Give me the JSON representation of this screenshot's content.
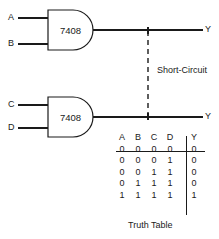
{
  "diagram": {
    "title": "Short-Circuit",
    "gates": [
      {
        "id": "gate-1",
        "part_number": "7408",
        "type": "AND",
        "inputs": [
          "A",
          "B"
        ],
        "output": "Y"
      },
      {
        "id": "gate-2",
        "part_number": "7408",
        "type": "AND",
        "inputs": [
          "C",
          "D"
        ],
        "output": "Y"
      }
    ],
    "short_circuit_label": "Short-Circuit",
    "input_labels": {
      "a": "A",
      "b": "B",
      "c": "C",
      "d": "D"
    },
    "output_labels": {
      "top": "Y",
      "bottom": "Y"
    },
    "colors": {
      "line": "#1a1a1a",
      "background": "#ffffff"
    }
  },
  "truth_table": {
    "caption": "Truth Table",
    "headers": [
      "A",
      "B",
      "C",
      "D",
      "Y"
    ],
    "rows": [
      [
        "0",
        "0",
        "0",
        "0",
        "0"
      ],
      [
        "0",
        "0",
        "0",
        "1",
        "0"
      ],
      [
        "0",
        "0",
        "1",
        "1",
        "0"
      ],
      [
        "0",
        "1",
        "1",
        "1",
        "0"
      ],
      [
        "1",
        "1",
        "1",
        "1",
        "1"
      ]
    ]
  }
}
